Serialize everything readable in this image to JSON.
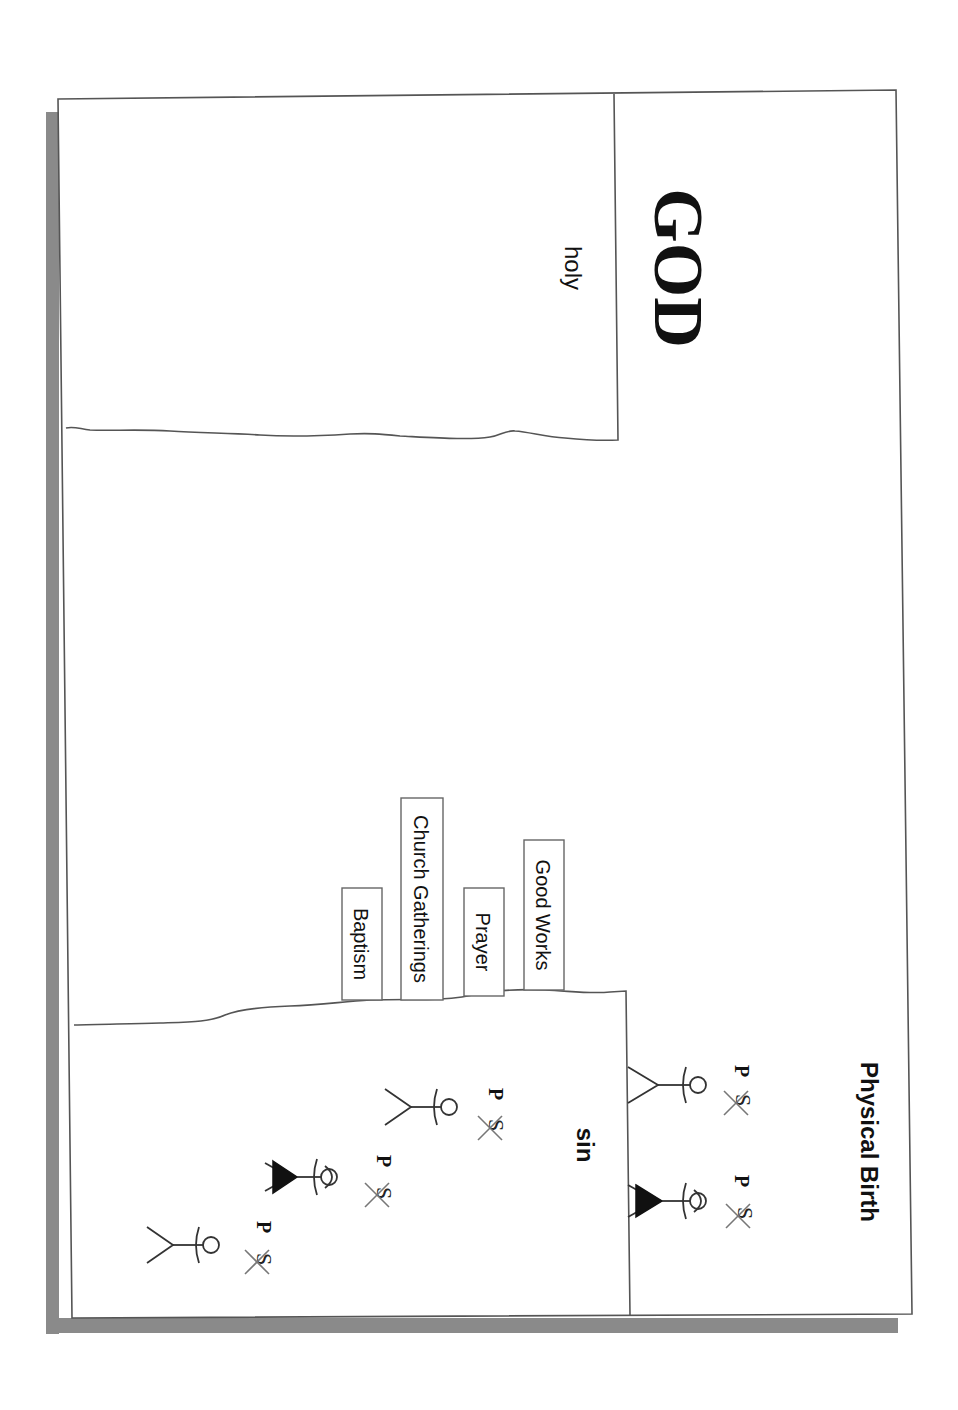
{
  "diagram": {
    "orientation": "rotated 90 degrees clockwise",
    "title": "GOD",
    "god_side_label": "holy",
    "human_side_label": "sin",
    "birth_label": "Physical Birth",
    "bridge_attempts": [
      {
        "label": "Good Works"
      },
      {
        "label": "Prayer"
      },
      {
        "label": "Church Gatherings"
      },
      {
        "label": "Baptism"
      }
    ],
    "figures": [
      {
        "id": "birth-figure-1",
        "type": "male",
        "marker_p": "P",
        "marker_s": "S",
        "s_crossed": true,
        "region": "physical-birth"
      },
      {
        "id": "birth-figure-2",
        "type": "female",
        "marker_p": "P",
        "marker_s": "S",
        "s_crossed": true,
        "region": "physical-birth"
      },
      {
        "id": "sin-figure-1",
        "type": "male",
        "marker_p": "P",
        "marker_s": "S",
        "s_crossed": true,
        "region": "sin"
      },
      {
        "id": "sin-figure-2",
        "type": "female",
        "marker_p": "P",
        "marker_s": "S",
        "s_crossed": true,
        "region": "sin"
      },
      {
        "id": "sin-figure-3",
        "type": "male",
        "marker_p": "P",
        "marker_s": "S",
        "s_crossed": true,
        "region": "sin"
      }
    ],
    "colors": {
      "background": "#ffffff",
      "frame_line": "#555555",
      "shadow": "#8a8a8a",
      "text": "#111111"
    }
  }
}
